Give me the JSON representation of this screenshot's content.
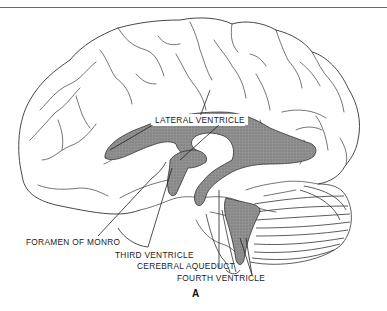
{
  "figure": {
    "panel_letter": "A",
    "labels": {
      "lateral_ventricle": "LATERAL VENTRICLE",
      "foramen_of_monro": "FORAMEN OF MONRO",
      "third_ventricle": "THIRD VENTRICLE",
      "cerebral_aqueduct": "CEREBRAL AQUEDUCT",
      "fourth_ventricle": "FOURTH VENTRICLE"
    },
    "colors": {
      "outline": "#333333",
      "ventricle_fill": "#8a8a8a",
      "background": "#ffffff"
    }
  }
}
